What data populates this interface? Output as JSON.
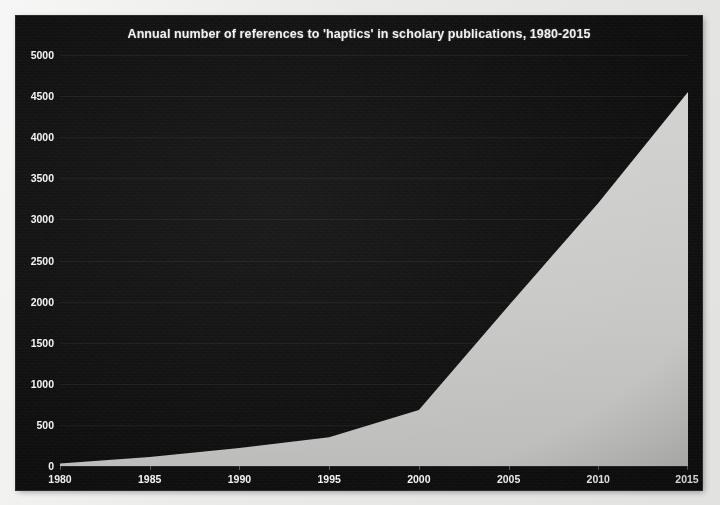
{
  "chart_data": {
    "type": "area",
    "title": "Annual number of references to 'haptics' in scholary publications, 1980-2015",
    "xlabel": "",
    "ylabel": "",
    "grid": true,
    "legend": "none",
    "xlim": [
      1980,
      2015
    ],
    "ylim": [
      0,
      5000
    ],
    "xticks": [
      "1980",
      "1985",
      "1990",
      "1995",
      "2000",
      "2005",
      "2010",
      "2015"
    ],
    "xtick_values": [
      1980,
      1985,
      1990,
      1995,
      2000,
      2005,
      2010,
      2015
    ],
    "yticks": [
      "0",
      "500",
      "1000",
      "1500",
      "2000",
      "2500",
      "3000",
      "3500",
      "4000",
      "4500",
      "5000"
    ],
    "ytick_values": [
      0,
      500,
      1000,
      1500,
      2000,
      2500,
      3000,
      3500,
      4000,
      4500,
      5000
    ],
    "x": [
      1980,
      1985,
      1990,
      1995,
      2000,
      2005,
      2010,
      2015
    ],
    "values": [
      30,
      110,
      220,
      350,
      680,
      1950,
      3200,
      4550
    ],
    "series": [
      {
        "name": "References to 'haptics'",
        "values": [
          30,
          110,
          220,
          350,
          680,
          1950,
          3200,
          4550
        ]
      }
    ],
    "colors": {
      "background": "#0d0d0d",
      "area_fill": "#c9c9c7",
      "text": "#f4f4f4",
      "gridline": "#2a2a2a",
      "page": "#ececeb"
    }
  }
}
